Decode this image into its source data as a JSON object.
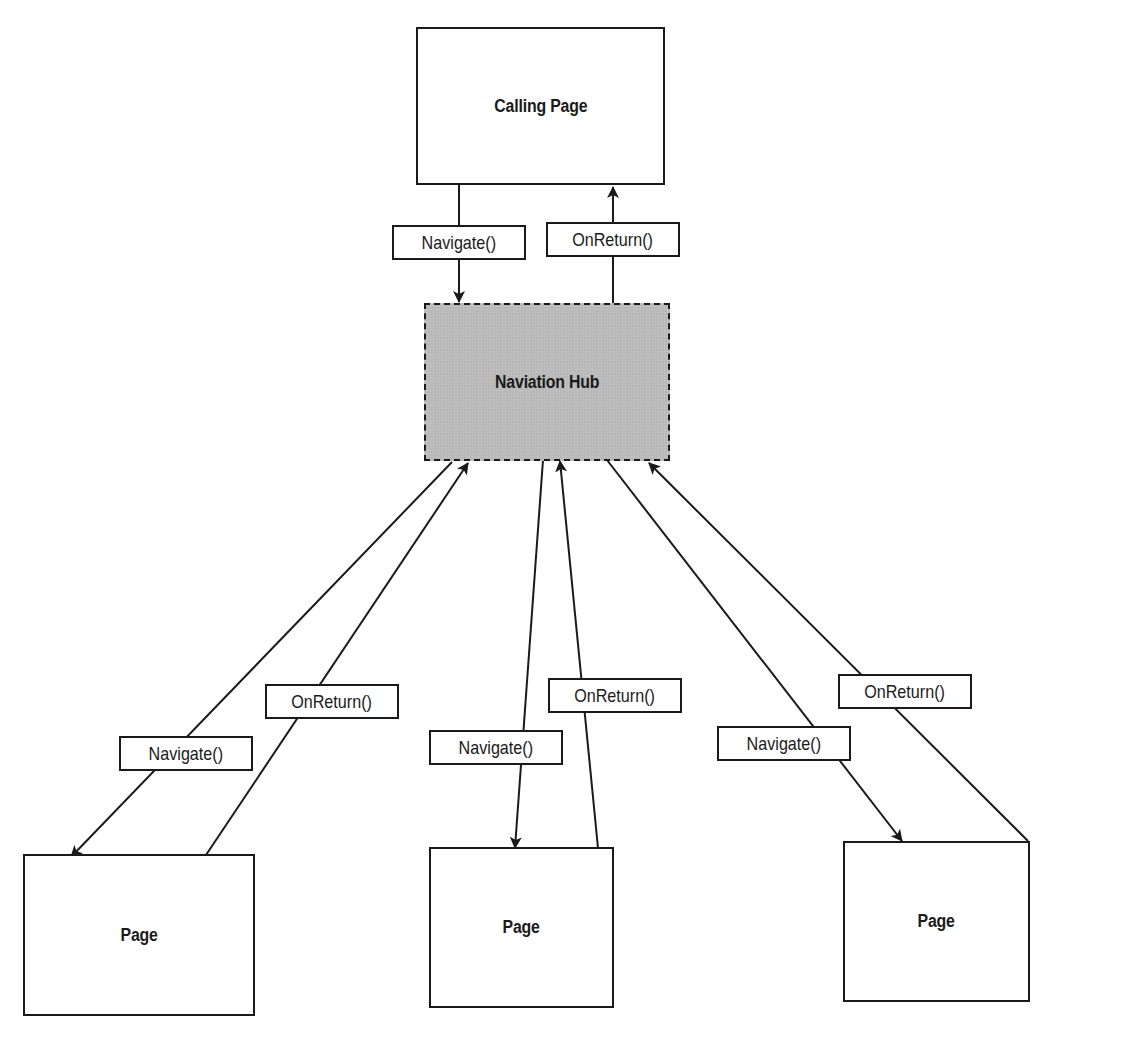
{
  "diagram": {
    "nodes": {
      "calling_page": {
        "label": "Calling Page"
      },
      "hub": {
        "label": "Naviation Hub"
      },
      "page_left": {
        "label": "Page"
      },
      "page_middle": {
        "label": "Page"
      },
      "page_right": {
        "label": "Page"
      }
    },
    "edges": [
      {
        "from": "Calling Page",
        "to": "Naviation Hub",
        "label": "Navigate()"
      },
      {
        "from": "Naviation Hub",
        "to": "Calling Page",
        "label": "OnReturn()"
      },
      {
        "from": "Naviation Hub",
        "to": "Page (left)",
        "label": "Navigate()"
      },
      {
        "from": "Page (left)",
        "to": "Naviation Hub",
        "label": "OnReturn()"
      },
      {
        "from": "Naviation Hub",
        "to": "Page (middle)",
        "label": "Navigate()"
      },
      {
        "from": "Page (middle)",
        "to": "Naviation Hub",
        "label": "OnReturn()"
      },
      {
        "from": "Naviation Hub",
        "to": "Page (right)",
        "label": "Navigate()"
      },
      {
        "from": "Page (right)",
        "to": "Naviation Hub",
        "label": "OnReturn()"
      }
    ],
    "colors": {
      "stroke": "#1a1a1a",
      "hub_fill": "#b9b9b9",
      "node_fill": "#ffffff"
    }
  }
}
